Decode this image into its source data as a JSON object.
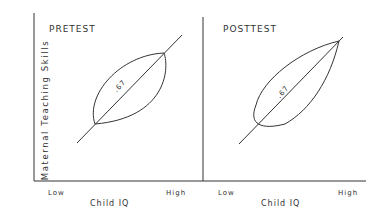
{
  "figure": {
    "y_axis_label": "Maternal  Teaching  Skills",
    "panels": [
      {
        "title": "PRETEST",
        "x_axis_label": "Child IQ",
        "x_tick_low": "Low",
        "x_tick_high": "High",
        "correlation_label": ".67",
        "ellipse_shape": "symmetric-lens"
      },
      {
        "title": "POSTTEST",
        "x_axis_label": "Child IQ",
        "x_tick_low": "Low",
        "x_tick_high": "High",
        "correlation_label": ".67",
        "ellipse_shape": "teardrop"
      }
    ]
  }
}
